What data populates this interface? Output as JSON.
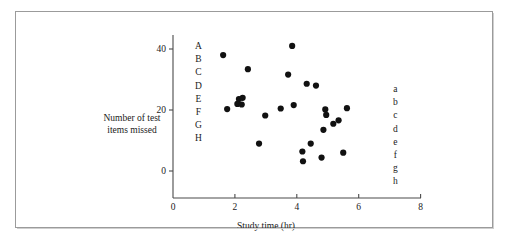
{
  "figure": {
    "background_color": "#ffffff",
    "frame_color": "#9b9b9b",
    "point_color": "#111111",
    "axis_color": "#4a4a4a"
  },
  "left_letters": [
    "A",
    "B",
    "C",
    "D",
    "E",
    "F",
    "G",
    "H"
  ],
  "right_letters": [
    "a",
    "b",
    "c",
    "d",
    "e",
    "f",
    "g",
    "h"
  ],
  "chart_data": {
    "type": "scatter",
    "title": "",
    "xlabel": "Study time (hr)",
    "ylabel": "Number of test items missed",
    "ylabel_lines": [
      "Number of test",
      "items missed"
    ],
    "xlim": [
      0,
      8
    ],
    "ylim": [
      0,
      46
    ],
    "xticks": [
      0,
      2,
      4,
      6,
      8
    ],
    "xtick_labels": [
      "0",
      "2",
      "4",
      "6",
      "8"
    ],
    "yticks": [
      0,
      20,
      40
    ],
    "ytick_labels": [
      "0",
      "20",
      "40"
    ],
    "grid": false,
    "legend": "none",
    "series": [
      {
        "name": "students",
        "marker": "filled-circle",
        "color": "#111111",
        "points": [
          {
            "x": 1.62,
            "y": 38.0
          },
          {
            "x": 1.75,
            "y": 20.3
          },
          {
            "x": 2.08,
            "y": 22.0
          },
          {
            "x": 2.13,
            "y": 23.6
          },
          {
            "x": 2.22,
            "y": 21.8
          },
          {
            "x": 2.25,
            "y": 24.0
          },
          {
            "x": 2.42,
            "y": 33.4
          },
          {
            "x": 2.78,
            "y": 9.0
          },
          {
            "x": 2.98,
            "y": 18.2
          },
          {
            "x": 3.48,
            "y": 20.5
          },
          {
            "x": 3.72,
            "y": 31.6
          },
          {
            "x": 3.85,
            "y": 41.0
          },
          {
            "x": 3.9,
            "y": 21.6
          },
          {
            "x": 4.18,
            "y": 6.4
          },
          {
            "x": 4.2,
            "y": 3.2
          },
          {
            "x": 4.32,
            "y": 28.6
          },
          {
            "x": 4.45,
            "y": 9.0
          },
          {
            "x": 4.62,
            "y": 28.0
          },
          {
            "x": 4.8,
            "y": 4.4
          },
          {
            "x": 4.86,
            "y": 13.5
          },
          {
            "x": 4.92,
            "y": 20.2
          },
          {
            "x": 4.95,
            "y": 18.4
          },
          {
            "x": 5.18,
            "y": 15.5
          },
          {
            "x": 5.35,
            "y": 16.6
          },
          {
            "x": 5.5,
            "y": 6.0
          },
          {
            "x": 5.62,
            "y": 20.6
          }
        ]
      }
    ]
  }
}
